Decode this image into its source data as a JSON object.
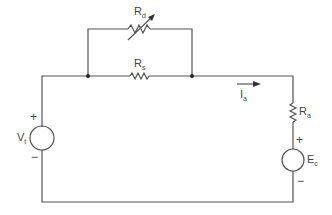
{
  "diagram": {
    "type": "circuit",
    "components": {
      "Rd": {
        "label": "R",
        "sub": "d",
        "kind": "variable-resistor"
      },
      "Rs": {
        "label": "R",
        "sub": "s",
        "kind": "resistor"
      },
      "Ra": {
        "label": "R",
        "sub": "a",
        "kind": "resistor"
      },
      "Vt": {
        "label": "V",
        "sub": "t",
        "kind": "voltage-source",
        "plus": "+",
        "minus": "−"
      },
      "Ec": {
        "label": "E",
        "sub": "c",
        "kind": "voltage-source",
        "plus": "+",
        "minus": "−"
      },
      "Ia": {
        "label": "I",
        "sub": "a",
        "kind": "current-arrow"
      }
    },
    "colors": {
      "wire": "#555555",
      "text": "#444444",
      "background": "#ffffff"
    }
  }
}
